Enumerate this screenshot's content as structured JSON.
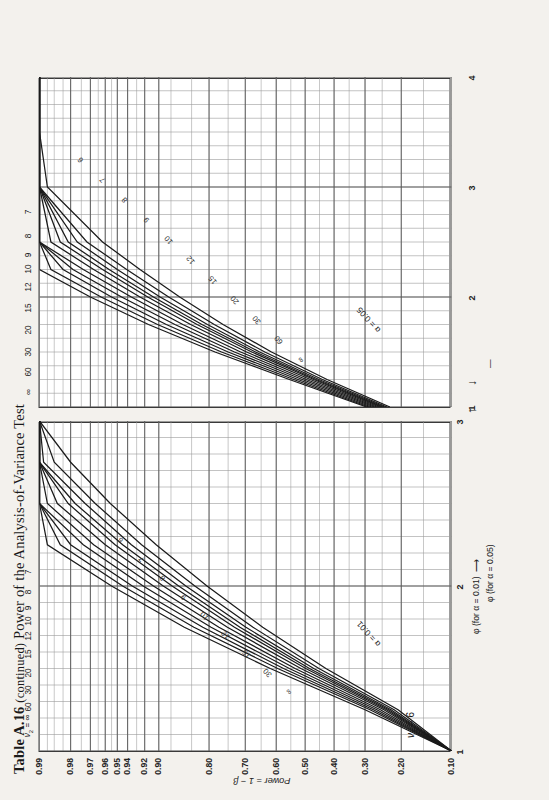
{
  "page": {
    "title_table": "Table A.16",
    "title_continued": "(continued)",
    "title_rest": "Power of the Analysis-of-Variance Test",
    "background_color": "#f3f1ed",
    "ink_color": "#222222"
  },
  "chart_data": {
    "type": "line",
    "title": "Table A.16 (continued) Power of the Analysis-of-Variance Test",
    "subtitle": "ν₁ = 6",
    "ylabel": "Power = 1 − β",
    "ylim": [
      0.1,
      0.99
    ],
    "ytick_labels": [
      "0.99",
      "0.98",
      "0.97",
      "0.96",
      "0.95",
      "0.94",
      "0.92",
      "0.90",
      "0.80",
      "0.70",
      "0.60",
      "0.50",
      "0.40",
      "0.30",
      "0.20",
      "0.10"
    ],
    "ytick_values": [
      0.99,
      0.98,
      0.97,
      0.96,
      0.95,
      0.94,
      0.92,
      0.9,
      0.8,
      0.7,
      0.6,
      0.5,
      0.4,
      0.3,
      0.2,
      0.1
    ],
    "grid": true,
    "legend_position": "inline-curve-labels",
    "v1_label": "ν₁ = 6",
    "v2_series_label": "ν₂ = ∞  60  30  20  15  12  10  9  8  7",
    "v2_values": [
      "∞",
      "60",
      "30",
      "20",
      "15",
      "12",
      "10",
      "9",
      "8",
      "7"
    ],
    "panels": [
      {
        "name": "alpha-0.01-panel",
        "alpha_label": "α = 0.01",
        "alpha": 0.01,
        "xlabel": "φ (for α = 0.01)",
        "xlim": [
          1,
          3
        ],
        "xtick_labels": [
          "1",
          "2",
          "3"
        ],
        "xtick_values": [
          1,
          2,
          3
        ],
        "curve_top_labels": [
          "ν₂ = ∞",
          "60",
          "30",
          "20",
          "15",
          "12",
          "10",
          "9",
          "8",
          "7"
        ],
        "curve_inner_labels": [
          "∞",
          "30",
          "15",
          "12",
          "10",
          "9",
          "8",
          "7",
          "6"
        ],
        "series": [
          {
            "name": "∞",
            "x": [
              1.0,
              1.25,
              1.5,
              1.75,
              2.0,
              2.25,
              2.5,
              2.75,
              3.0
            ],
            "y": [
              0.1,
              0.3,
              0.62,
              0.855,
              0.955,
              0.988,
              0.996,
              0.9985,
              0.999
            ]
          },
          {
            "name": "60",
            "x": [
              1.0,
              1.25,
              1.5,
              1.75,
              2.0,
              2.25,
              2.5,
              2.75,
              3.0
            ],
            "y": [
              0.1,
              0.285,
              0.595,
              0.835,
              0.945,
              0.984,
              0.995,
              0.998,
              0.999
            ]
          },
          {
            "name": "30",
            "x": [
              1.0,
              1.25,
              1.5,
              1.75,
              2.0,
              2.25,
              2.5,
              2.75,
              3.0
            ],
            "y": [
              0.1,
              0.275,
              0.575,
              0.815,
              0.935,
              0.98,
              0.993,
              0.997,
              0.999
            ]
          },
          {
            "name": "20",
            "x": [
              1.0,
              1.25,
              1.5,
              1.75,
              2.0,
              2.25,
              2.5,
              2.75,
              3.0
            ],
            "y": [
              0.1,
              0.265,
              0.555,
              0.795,
              0.922,
              0.974,
              0.991,
              0.996,
              0.998
            ]
          },
          {
            "name": "15",
            "x": [
              1.0,
              1.25,
              1.5,
              1.75,
              2.0,
              2.25,
              2.5,
              2.75,
              3.0
            ],
            "y": [
              0.1,
              0.255,
              0.535,
              0.775,
              0.908,
              0.968,
              0.988,
              0.995,
              0.998
            ]
          },
          {
            "name": "12",
            "x": [
              1.0,
              1.25,
              1.5,
              1.75,
              2.0,
              2.25,
              2.5,
              2.75,
              3.0
            ],
            "y": [
              0.1,
              0.245,
              0.515,
              0.752,
              0.893,
              0.96,
              0.985,
              0.994,
              0.997
            ]
          },
          {
            "name": "10",
            "x": [
              1.0,
              1.25,
              1.5,
              1.75,
              2.0,
              2.25,
              2.5,
              2.75,
              3.0
            ],
            "y": [
              0.1,
              0.238,
              0.498,
              0.732,
              0.878,
              0.952,
              0.981,
              0.992,
              0.997
            ]
          },
          {
            "name": "9",
            "x": [
              1.0,
              1.25,
              1.5,
              1.75,
              2.0,
              2.25,
              2.5,
              2.75,
              3.0
            ],
            "y": [
              0.1,
              0.232,
              0.485,
              0.716,
              0.866,
              0.945,
              0.978,
              0.991,
              0.996
            ]
          },
          {
            "name": "8",
            "x": [
              1.0,
              1.25,
              1.5,
              1.75,
              2.0,
              2.25,
              2.5,
              2.75,
              3.0
            ],
            "y": [
              0.1,
              0.226,
              0.47,
              0.698,
              0.852,
              0.936,
              0.973,
              0.989,
              0.995
            ]
          },
          {
            "name": "7",
            "x": [
              1.0,
              1.25,
              1.5,
              1.75,
              2.0,
              2.25,
              2.5,
              2.75,
              3.0
            ],
            "y": [
              0.1,
              0.218,
              0.452,
              0.676,
              0.833,
              0.924,
              0.967,
              0.986,
              0.994
            ]
          },
          {
            "name": "6",
            "x": [
              1.0,
              1.25,
              1.5,
              1.75,
              2.0,
              2.25,
              2.5,
              2.75,
              3.0
            ],
            "y": [
              0.1,
              0.208,
              0.428,
              0.645,
              0.805,
              0.904,
              0.956,
              0.98,
              0.991
            ]
          }
        ]
      },
      {
        "name": "alpha-0.05-panel",
        "alpha_label": "α = 0.05",
        "alpha": 0.05,
        "xlabel": "φ (for α = 0.05)",
        "xlim": [
          1,
          4
        ],
        "xtick_labels": [
          "1",
          "2",
          "3",
          "4"
        ],
        "xtick_values": [
          1,
          2,
          3,
          4
        ],
        "curve_top_labels": [
          "∞",
          "60",
          "30",
          "20",
          "15",
          "12",
          "10",
          "9",
          "8",
          "7"
        ],
        "curve_inner_labels": [
          "∞",
          "60",
          "30",
          "20",
          "15",
          "12",
          "10",
          "9",
          "8",
          "7",
          "6"
        ],
        "series": [
          {
            "name": "∞",
            "x": [
              1.0,
              1.25,
              1.5,
              1.75,
              2.0,
              2.25,
              2.5,
              3.0,
              3.5,
              4.0
            ],
            "y": [
              0.295,
              0.555,
              0.785,
              0.915,
              0.97,
              0.99,
              0.9965,
              0.9993,
              0.9998,
              0.9999
            ]
          },
          {
            "name": "60",
            "x": [
              1.0,
              1.25,
              1.5,
              1.75,
              2.0,
              2.25,
              2.5,
              3.0,
              3.5,
              4.0
            ],
            "y": [
              0.288,
              0.54,
              0.768,
              0.902,
              0.963,
              0.987,
              0.9955,
              0.999,
              0.9997,
              0.9999
            ]
          },
          {
            "name": "30",
            "x": [
              1.0,
              1.25,
              1.5,
              1.75,
              2.0,
              2.25,
              2.5,
              3.0,
              3.5,
              4.0
            ],
            "y": [
              0.28,
              0.525,
              0.75,
              0.888,
              0.955,
              0.983,
              0.994,
              0.9985,
              0.9996,
              0.9998
            ]
          },
          {
            "name": "20",
            "x": [
              1.0,
              1.25,
              1.5,
              1.75,
              2.0,
              2.25,
              2.5,
              3.0,
              3.5,
              4.0
            ],
            "y": [
              0.272,
              0.51,
              0.732,
              0.873,
              0.946,
              0.979,
              0.992,
              0.998,
              0.9994,
              0.9998
            ]
          },
          {
            "name": "15",
            "x": [
              1.0,
              1.25,
              1.5,
              1.75,
              2.0,
              2.25,
              2.5,
              3.0,
              3.5,
              4.0
            ],
            "y": [
              0.265,
              0.496,
              0.714,
              0.858,
              0.936,
              0.974,
              0.99,
              0.9975,
              0.9992,
              0.9997
            ]
          },
          {
            "name": "12",
            "x": [
              1.0,
              1.25,
              1.5,
              1.75,
              2.0,
              2.25,
              2.5,
              3.0,
              3.5,
              4.0
            ],
            "y": [
              0.258,
              0.482,
              0.696,
              0.842,
              0.926,
              0.968,
              0.987,
              0.997,
              0.999,
              0.9996
            ]
          },
          {
            "name": "10",
            "x": [
              1.0,
              1.25,
              1.5,
              1.75,
              2.0,
              2.25,
              2.5,
              3.0,
              3.5,
              4.0
            ],
            "y": [
              0.252,
              0.47,
              0.68,
              0.828,
              0.916,
              0.962,
              0.984,
              0.996,
              0.9988,
              0.9995
            ]
          },
          {
            "name": "9",
            "x": [
              1.0,
              1.25,
              1.5,
              1.75,
              2.0,
              2.25,
              2.5,
              3.0,
              3.5,
              4.0
            ],
            "y": [
              0.248,
              0.462,
              0.668,
              0.817,
              0.908,
              0.957,
              0.981,
              0.995,
              0.9985,
              0.9994
            ]
          },
          {
            "name": "8",
            "x": [
              1.0,
              1.25,
              1.5,
              1.75,
              2.0,
              2.25,
              2.5,
              3.0,
              3.5,
              4.0
            ],
            "y": [
              0.243,
              0.452,
              0.655,
              0.804,
              0.898,
              0.95,
              0.977,
              0.994,
              0.998,
              0.9992
            ]
          },
          {
            "name": "7",
            "x": [
              1.0,
              1.25,
              1.5,
              1.75,
              2.0,
              2.25,
              2.5,
              3.0,
              3.5,
              4.0
            ],
            "y": [
              0.237,
              0.44,
              0.638,
              0.787,
              0.884,
              0.941,
              0.972,
              0.992,
              0.9975,
              0.999
            ]
          },
          {
            "name": "6",
            "x": [
              1.0,
              1.25,
              1.5,
              1.75,
              2.0,
              2.25,
              2.5,
              3.0,
              3.5,
              4.0
            ],
            "y": [
              0.229,
              0.424,
              0.616,
              0.764,
              0.864,
              0.926,
              0.962,
              0.988,
              0.996,
              0.9985
            ]
          }
        ]
      }
    ],
    "axis_arrows": {
      "upper_axis_tick": "3",
      "lower_axis_tick": "1",
      "upper_label": "φ (for α = 0.01)",
      "lower_label": "φ (for α = 0.05)",
      "lower_tick_2": "2"
    }
  }
}
